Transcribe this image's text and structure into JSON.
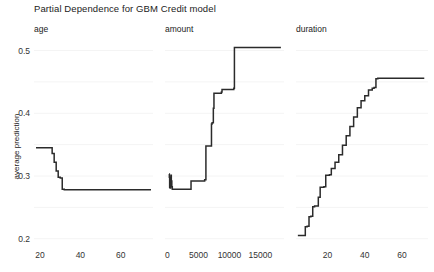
{
  "chart_data": {
    "type": "line",
    "title": "Partial Dependence for GBM Credit model",
    "ylabel": "average prediction",
    "xlabel": "",
    "ylim": [
      0.19,
      0.52
    ],
    "grid": true,
    "legend": "none",
    "yticks": [
      0.2,
      0.3,
      0.4,
      0.5
    ],
    "ytick_labels": [
      "0.2",
      "0.3",
      "0.4",
      "0.5"
    ],
    "panels": [
      {
        "name": "age",
        "label": "age",
        "xlim": [
          17,
          76
        ],
        "xticks": [
          20,
          40,
          60
        ],
        "xtick_labels": [
          "20",
          "40",
          "60"
        ],
        "x": [
          18,
          25,
          26,
          27,
          28,
          29,
          30,
          31,
          32,
          75
        ],
        "y": [
          0.345,
          0.345,
          0.336,
          0.322,
          0.308,
          0.298,
          0.297,
          0.279,
          0.278,
          0.278
        ]
      },
      {
        "name": "amount",
        "label": "amount",
        "xlim": [
          -400,
          18800
        ],
        "xticks": [
          0,
          5000,
          10000,
          15000
        ],
        "xtick_labels": [
          "0",
          "5000",
          "10000",
          "15000"
        ],
        "x": [
          250,
          300,
          350,
          420,
          500,
          560,
          620,
          700,
          780,
          900,
          1100,
          3700,
          3800,
          5900,
          6000,
          6200,
          7100,
          7200,
          7400,
          7500,
          8700,
          8800,
          10700,
          10800,
          18300
        ],
        "y": [
          0.303,
          0.298,
          0.282,
          0.281,
          0.297,
          0.301,
          0.292,
          0.283,
          0.279,
          0.279,
          0.279,
          0.279,
          0.292,
          0.292,
          0.294,
          0.348,
          0.383,
          0.385,
          0.408,
          0.432,
          0.434,
          0.438,
          0.44,
          0.505,
          0.505
        ]
      },
      {
        "name": "duration",
        "label": "duration",
        "xlim": [
          3,
          74
        ],
        "xticks": [
          20,
          40,
          60
        ],
        "xtick_labels": [
          "20",
          "40",
          "60"
        ],
        "x": [
          4,
          7,
          8,
          9,
          10,
          11,
          12,
          13,
          15,
          16,
          18,
          19,
          21,
          22,
          24,
          26,
          28,
          30,
          32,
          34,
          36,
          38,
          40,
          42,
          44,
          45,
          46,
          47,
          48,
          72
        ],
        "y": [
          0.205,
          0.205,
          0.219,
          0.22,
          0.235,
          0.236,
          0.251,
          0.252,
          0.266,
          0.282,
          0.283,
          0.301,
          0.302,
          0.312,
          0.322,
          0.334,
          0.349,
          0.364,
          0.379,
          0.394,
          0.409,
          0.42,
          0.428,
          0.437,
          0.44,
          0.441,
          0.455,
          0.456,
          0.456,
          0.456
        ]
      }
    ]
  }
}
